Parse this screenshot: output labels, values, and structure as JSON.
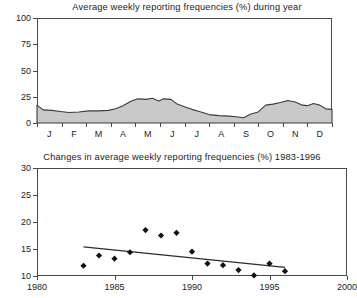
{
  "figure": {
    "background": "#ffffff",
    "axis_color": "#4a4a4a",
    "area_fill": "#c9c9c9",
    "marker_color": "#111111"
  },
  "chart_data": [
    {
      "type": "area",
      "title": "Average weekly reporting frequencies (%) during year",
      "xlabel": "",
      "ylabel": "",
      "ylim": [
        0,
        100
      ],
      "yticks": [
        0,
        25,
        50,
        75,
        100
      ],
      "ytick_labels": [
        "0",
        "25",
        "50",
        "75",
        "100"
      ],
      "grid": false,
      "legend": "none",
      "categories": [
        "J",
        "F",
        "M",
        "A",
        "M",
        "J",
        "J",
        "A",
        "S",
        "O",
        "N",
        "D"
      ],
      "xtick_labels": [
        "J",
        "F",
        "M",
        "A",
        "M",
        "J",
        "J",
        "A",
        "S",
        "O",
        "N",
        "D"
      ],
      "x": [
        0.0,
        0.4,
        0.9,
        1.4,
        1.9,
        2.4,
        2.9,
        3.4,
        3.9,
        4.4,
        4.9,
        5.4,
        5.9,
        6.4,
        6.9,
        7.4,
        7.9,
        8.4,
        8.9,
        9.4,
        9.9,
        10.4,
        10.9,
        11.5,
        12.0
      ],
      "values": [
        17.0,
        12.0,
        11.5,
        10.0,
        10.5,
        11.0,
        11.5,
        12.5,
        14.0,
        16.0,
        21.0,
        23.5,
        22.0,
        23.0,
        22.5,
        19.0,
        15.0,
        12.0,
        8.0,
        6.5,
        5.0,
        9.0,
        16.5,
        20.0,
        21.5
      ],
      "series": [
        {
          "name": "Average weekly reporting frequency",
          "points": [
            {
              "x": 0.0,
              "y": 17.0
            },
            {
              "x": 0.25,
              "y": 12.5
            },
            {
              "x": 0.6,
              "y": 12.0
            },
            {
              "x": 0.95,
              "y": 11.0
            },
            {
              "x": 1.3,
              "y": 10.0
            },
            {
              "x": 1.7,
              "y": 10.5
            },
            {
              "x": 2.1,
              "y": 11.5
            },
            {
              "x": 2.5,
              "y": 11.5
            },
            {
              "x": 2.9,
              "y": 12.0
            },
            {
              "x": 3.2,
              "y": 13.5
            },
            {
              "x": 3.5,
              "y": 16.5
            },
            {
              "x": 3.8,
              "y": 20.5
            },
            {
              "x": 4.1,
              "y": 23.0
            },
            {
              "x": 4.45,
              "y": 22.5
            },
            {
              "x": 4.7,
              "y": 23.5
            },
            {
              "x": 4.95,
              "y": 21.0
            },
            {
              "x": 5.15,
              "y": 23.0
            },
            {
              "x": 5.45,
              "y": 22.5
            },
            {
              "x": 5.7,
              "y": 18.0
            },
            {
              "x": 6.0,
              "y": 15.5
            },
            {
              "x": 6.3,
              "y": 13.0
            },
            {
              "x": 6.6,
              "y": 11.0
            },
            {
              "x": 7.0,
              "y": 8.0
            },
            {
              "x": 7.4,
              "y": 7.0
            },
            {
              "x": 7.8,
              "y": 6.5
            },
            {
              "x": 8.1,
              "y": 6.0
            },
            {
              "x": 8.4,
              "y": 5.0
            },
            {
              "x": 8.7,
              "y": 8.5
            },
            {
              "x": 9.0,
              "y": 10.5
            },
            {
              "x": 9.3,
              "y": 17.0
            },
            {
              "x": 9.6,
              "y": 18.0
            },
            {
              "x": 9.9,
              "y": 19.5
            },
            {
              "x": 10.2,
              "y": 21.5
            },
            {
              "x": 10.5,
              "y": 20.0
            },
            {
              "x": 10.8,
              "y": 17.0
            },
            {
              "x": 11.0,
              "y": 16.5
            },
            {
              "x": 11.25,
              "y": 18.5
            },
            {
              "x": 11.5,
              "y": 17.0
            },
            {
              "x": 11.75,
              "y": 13.5
            },
            {
              "x": 12.0,
              "y": 13.0
            }
          ]
        }
      ]
    },
    {
      "type": "scatter",
      "title": "Changes in average weekly reporting frequencies (%) 1983-1996",
      "xlabel": "",
      "ylabel": "",
      "xlim": [
        1980,
        2000
      ],
      "ylim": [
        10,
        30
      ],
      "xticks": [
        1980,
        1985,
        1990,
        1995,
        2000
      ],
      "xtick_labels": [
        "1980",
        "1985",
        "1990",
        "1995",
        "2000"
      ],
      "yticks": [
        10,
        15,
        20,
        25,
        30
      ],
      "ytick_labels": [
        "10",
        "15",
        "20",
        "25",
        "30"
      ],
      "grid": false,
      "legend": "none",
      "series": [
        {
          "name": "Annual average weekly reporting frequency",
          "marker": "diamond",
          "x": [
            1983,
            1984,
            1985,
            1986,
            1987,
            1988,
            1989,
            1990,
            1991,
            1992,
            1993,
            1994,
            1995,
            1996
          ],
          "y": [
            11.9,
            13.8,
            13.2,
            14.4,
            18.5,
            17.5,
            18.0,
            14.5,
            12.3,
            12.0,
            11.1,
            10.1,
            12.3,
            10.9
          ]
        }
      ],
      "trend_line": {
        "name": "linear trend",
        "x": [
          1983,
          1996
        ],
        "y": [
          15.4,
          11.6
        ]
      }
    }
  ]
}
